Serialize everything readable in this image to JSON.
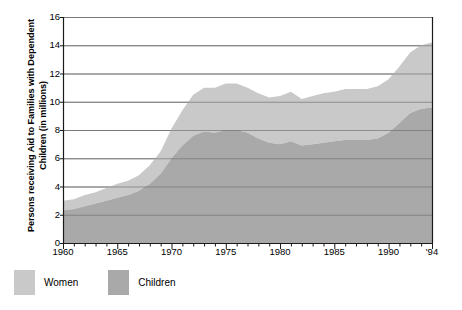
{
  "chart_data": {
    "type": "area",
    "stacked": true,
    "title": "",
    "xlabel": "",
    "ylabel": "Persons receiving Aid to Families with Dependent Children (in millions)",
    "xlim": [
      1960,
      1994
    ],
    "ylim": [
      0,
      16
    ],
    "ytick_values": [
      0,
      2,
      4,
      6,
      8,
      10,
      12,
      14,
      16
    ],
    "ytick_labels": [
      "0",
      "2",
      "4",
      "6",
      "8",
      "10",
      "12",
      "14",
      "16"
    ],
    "xtick_values": [
      1960,
      1965,
      1970,
      1975,
      1980,
      1985,
      1990,
      1994
    ],
    "xtick_labels": [
      "1960",
      "1965",
      "1970",
      "1975",
      "1980",
      "1985",
      "1990",
      "'94"
    ],
    "minor_xticks_every": 1,
    "grid": "horizontal",
    "legend_position": "below-left",
    "x": [
      1960,
      1961,
      1962,
      1963,
      1964,
      1965,
      1966,
      1967,
      1968,
      1969,
      1970,
      1971,
      1972,
      1973,
      1974,
      1975,
      1976,
      1977,
      1978,
      1979,
      1980,
      1981,
      1982,
      1983,
      1984,
      1985,
      1986,
      1987,
      1988,
      1989,
      1990,
      1991,
      1992,
      1993,
      1994
    ],
    "series": [
      {
        "name": "Children",
        "color": "#a9a9a9",
        "values": [
          2.3,
          2.4,
          2.6,
          2.8,
          3.0,
          3.2,
          3.4,
          3.7,
          4.2,
          4.9,
          6.0,
          6.9,
          7.6,
          7.9,
          7.8,
          8.0,
          8.0,
          7.8,
          7.4,
          7.1,
          7.0,
          7.2,
          6.9,
          7.0,
          7.1,
          7.2,
          7.3,
          7.3,
          7.3,
          7.4,
          7.8,
          8.5,
          9.2,
          9.5,
          9.6
        ]
      },
      {
        "name": "Women",
        "color": "#c9c9c9",
        "values": [
          0.7,
          0.7,
          0.8,
          0.8,
          0.9,
          1.0,
          1.0,
          1.1,
          1.3,
          1.6,
          2.1,
          2.5,
          2.9,
          3.1,
          3.2,
          3.3,
          3.3,
          3.2,
          3.2,
          3.2,
          3.4,
          3.5,
          3.3,
          3.4,
          3.5,
          3.5,
          3.6,
          3.6,
          3.6,
          3.7,
          3.8,
          4.0,
          4.3,
          4.5,
          4.6
        ]
      }
    ],
    "totals": [
      3.0,
      3.1,
      3.4,
      3.6,
      3.9,
      4.2,
      4.4,
      4.8,
      5.5,
      6.5,
      8.1,
      9.4,
      10.5,
      11.0,
      11.0,
      11.3,
      11.3,
      11.0,
      10.6,
      10.3,
      10.4,
      10.7,
      10.2,
      10.4,
      10.6,
      10.7,
      10.9,
      10.9,
      10.9,
      11.1,
      11.6,
      12.5,
      13.5,
      14.0,
      14.2
    ]
  },
  "legend": {
    "entries": [
      {
        "label": "Women",
        "color": "#c9c9c9"
      },
      {
        "label": "Children",
        "color": "#a9a9a9"
      }
    ]
  },
  "axes": {
    "y_title": "Persons receiving Aid to Families with Dependent Children (in millions)"
  },
  "colors": {
    "background": "#ffffff",
    "axis": "#1a1a1a",
    "gridline": "#8a8a8a",
    "women_fill": "#c9c9c9",
    "children_fill": "#a9a9a9",
    "text": "#000000"
  }
}
